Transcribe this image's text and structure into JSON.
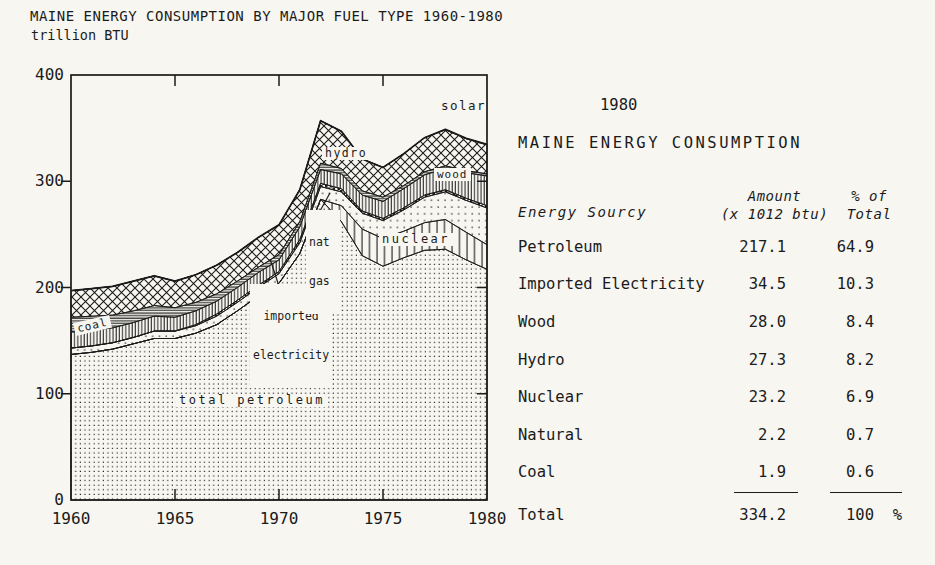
{
  "page": {
    "title": "MAINE ENERGY CONSUMPTION BY MAJOR FUEL TYPE 1960-1980",
    "subtitle": "trillion BTU"
  },
  "chart_data": {
    "type": "area",
    "stacked": true,
    "title": "MAINE ENERGY CONSUMPTION BY MAJOR FUEL TYPE 1960-1980",
    "ylabel": "trillion BTU",
    "units": "trillion BTU",
    "ylim": [
      0,
      400
    ],
    "xlim": [
      1960,
      1980
    ],
    "yticks": [
      0,
      100,
      200,
      300,
      400
    ],
    "xticks": [
      1960,
      1965,
      1970,
      1975,
      1980
    ],
    "grid": false,
    "x": [
      1960,
      1961,
      1962,
      1963,
      1964,
      1965,
      1966,
      1967,
      1968,
      1969,
      1970,
      1971,
      1972,
      1973,
      1974,
      1975,
      1976,
      1977,
      1978,
      1979,
      1980
    ],
    "series": [
      {
        "name": "total petroleum",
        "key": "petroleum",
        "pattern": "fine-dots",
        "values": [
          137,
          139,
          142,
          147,
          152,
          152,
          157,
          165,
          178,
          192,
          204,
          232,
          283,
          262,
          230,
          220,
          228,
          235,
          236,
          226,
          217.1
        ]
      },
      {
        "name": "nuclear",
        "key": "nuclear",
        "pattern": "vertical-lines",
        "values": [
          0,
          0,
          0,
          0,
          0,
          0,
          0,
          0,
          0,
          0,
          0,
          0,
          0,
          15,
          25,
          26,
          25,
          26,
          28,
          26,
          23.2
        ]
      },
      {
        "name": "imported electricity",
        "key": "imported_electricity",
        "pattern": "sparse-dots",
        "values": [
          6,
          6,
          6,
          6,
          7,
          7,
          7,
          8,
          8,
          8,
          9,
          10,
          12,
          13,
          15,
          17,
          20,
          24,
          26,
          30,
          34.5
        ]
      },
      {
        "name": "nat gas",
        "key": "nat_gas",
        "pattern": "checker",
        "values": [
          0,
          0,
          0,
          0,
          0,
          0,
          1,
          2,
          2,
          2,
          2,
          3,
          3,
          3,
          2,
          2,
          2,
          2,
          2,
          2,
          2.2
        ]
      },
      {
        "name": "wood",
        "key": "wood",
        "pattern": "dense-vertical-lines",
        "values": [
          15,
          15,
          14,
          14,
          14,
          13,
          13,
          12,
          12,
          12,
          11,
          12,
          13,
          14,
          15,
          16,
          18,
          19,
          20,
          24,
          28
        ]
      },
      {
        "name": "coal",
        "key": "coal",
        "pattern": "horizontal-lines",
        "values": [
          14,
          13,
          12,
          11,
          10,
          9,
          8,
          7,
          6,
          5,
          5,
          5,
          6,
          5,
          4,
          4,
          3,
          3,
          2.5,
          2,
          1.9
        ]
      },
      {
        "name": "hydro",
        "key": "hydro",
        "pattern": "crosshatch",
        "values": [
          25,
          26,
          27,
          28,
          28,
          25,
          26,
          27,
          27,
          28,
          28,
          30,
          40,
          35,
          30,
          28,
          30,
          32,
          34,
          30,
          27.3
        ]
      },
      {
        "name": "solar",
        "key": "solar",
        "pattern": "plain",
        "values": [
          0,
          0,
          0,
          0,
          0,
          0,
          0,
          0,
          0,
          0,
          0,
          0,
          0,
          0,
          0,
          0,
          0,
          0,
          0.3,
          0.4,
          0.5
        ]
      }
    ],
    "labels": {
      "total_petroleum": "total petroleum",
      "coal": "coal",
      "imported_line1": "imported",
      "imported_line2": "electricity",
      "natgas_line1": "nat",
      "natgas_line2": "gas",
      "nuclear": "nuclear",
      "wood": "wood",
      "hydro": "hydro",
      "solar": "solar"
    }
  },
  "table": {
    "year_heading": "1980",
    "title": "MAINE ENERGY CONSUMPTION",
    "columns": {
      "source": "Energy Sourcy",
      "amount_line1": "Amount",
      "amount_line2": "(x 1012 btu)",
      "pct_line1": "% of",
      "pct_line2": "Total"
    },
    "rows": [
      {
        "source": "Petroleum",
        "amount": "217.1",
        "pct": "64.9"
      },
      {
        "source": "Imported Electricity",
        "amount": "34.5",
        "pct": "10.3"
      },
      {
        "source": "Wood",
        "amount": "28.0",
        "pct": "8.4"
      },
      {
        "source": "Hydro",
        "amount": "27.3",
        "pct": "8.2"
      },
      {
        "source": "Nuclear",
        "amount": "23.2",
        "pct": "6.9"
      },
      {
        "source": "Natural",
        "amount": "2.2",
        "pct": "0.7"
      },
      {
        "source": "Coal",
        "amount": "1.9",
        "pct": "0.6"
      }
    ],
    "total": {
      "label": "Total",
      "amount": "334.2",
      "pct": "100  %"
    }
  },
  "colors": {
    "ink": "#1b1b1b",
    "paper": "#f7f6f1"
  }
}
